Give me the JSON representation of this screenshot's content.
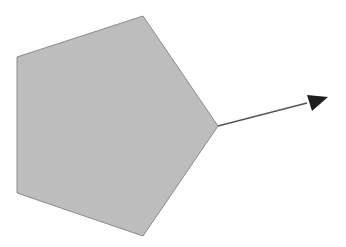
{
  "diagram": {
    "width": 346,
    "height": 247,
    "background": "#ffffff",
    "pentagon": {
      "points": "143,16 218,126 143,236 17,193 17,57",
      "fill": "#bdbdbd",
      "stroke": "#8a8a8a",
      "stroke_width": 1
    },
    "arrow": {
      "x1": 218,
      "y1": 126,
      "x2": 307,
      "y2": 103,
      "stroke": "#555555",
      "stroke_width": 1.3,
      "head_points": "328,97 307,95 312,111",
      "head_fill": "#1e1e1e"
    }
  }
}
